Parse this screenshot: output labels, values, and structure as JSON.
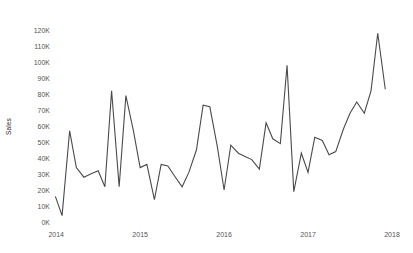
{
  "chart_data": {
    "type": "line",
    "title": "",
    "xlabel": "",
    "ylabel": "Sales",
    "legend": [],
    "grid": false,
    "xlim": [
      2013.95,
      2018.0
    ],
    "ylim": [
      0,
      125000
    ],
    "y_ticks": [
      0,
      10000,
      20000,
      30000,
      40000,
      50000,
      60000,
      70000,
      80000,
      90000,
      100000,
      110000,
      120000
    ],
    "y_tick_labels": [
      "0K",
      "10K",
      "20K",
      "30K",
      "40K",
      "50K",
      "60K",
      "70K",
      "80K",
      "90K",
      "100K",
      "110K",
      "120K"
    ],
    "x_ticks": [
      2014,
      2015,
      2016,
      2017,
      2018
    ],
    "x_tick_labels": [
      "2014",
      "2015",
      "2016",
      "2017",
      "2018"
    ],
    "line_color": "#4a4a4a",
    "line_width": 1.1,
    "series": [
      {
        "name": "Sales",
        "x": [
          2013.99,
          2014.07,
          2014.16,
          2014.24,
          2014.33,
          2014.41,
          2014.5,
          2014.58,
          2014.66,
          2014.75,
          2014.83,
          2014.92,
          2015.0,
          2015.08,
          2015.17,
          2015.25,
          2015.33,
          2015.42,
          2015.5,
          2015.58,
          2015.67,
          2015.75,
          2015.83,
          2015.92,
          2016.0,
          2016.08,
          2016.17,
          2016.25,
          2016.33,
          2016.42,
          2016.5,
          2016.58,
          2016.67,
          2016.75,
          2016.83,
          2016.92,
          2017.0,
          2017.08,
          2017.17,
          2017.25,
          2017.33,
          2017.42,
          2017.5,
          2017.58,
          2017.67,
          2017.75,
          2017.83,
          2017.92
        ],
        "values": [
          16000,
          4000,
          57000,
          34000,
          28000,
          30000,
          32000,
          22000,
          82000,
          22000,
          79000,
          57000,
          34000,
          36000,
          14000,
          36000,
          35000,
          28000,
          22000,
          31000,
          45000,
          73000,
          72000,
          47000,
          20000,
          48000,
          43000,
          41000,
          39000,
          33000,
          62000,
          52000,
          49000,
          98000,
          19000,
          43000,
          31000,
          53000,
          51000,
          42000,
          44000,
          58000,
          68000,
          75000,
          68000,
          82000,
          118000,
          83000
        ]
      }
    ]
  }
}
